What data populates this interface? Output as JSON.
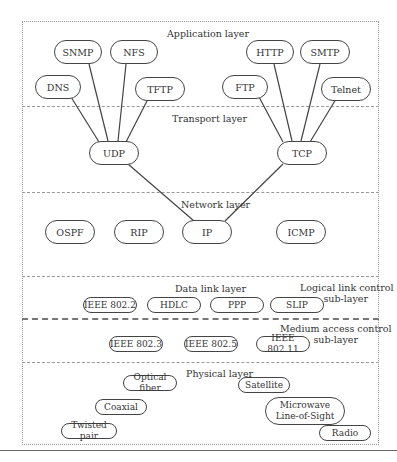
{
  "layers": {
    "application": "Application layer",
    "transport": "Transport layer",
    "network": "Network layer",
    "data_link": "Data link layer",
    "llc": "Logical link control sub-layer",
    "mac": "Medium access control sub-layer",
    "physical": "Physical layer"
  },
  "llc_lines": [
    "Logical link control",
    "sub-layer"
  ],
  "mac_lines": [
    "Medium access control",
    "sub-layer"
  ],
  "nodes": {
    "snmp": "SNMP",
    "nfs": "NFS",
    "dns": "DNS",
    "tftp": "TFTP",
    "http": "HTTP",
    "smtp": "SMTP",
    "ftp": "FTP",
    "telnet": "Telnet",
    "udp": "UDP",
    "tcp": "TCP",
    "ospf": "OSPF",
    "rip": "RIP",
    "ip": "IP",
    "icmp": "ICMP",
    "ieee8022": "IEEE 802.2",
    "hdlc": "HDLC",
    "ppp": "PPP",
    "slip": "SLIP",
    "ieee8023": "IEEE 802.3",
    "ieee8025": "IEEE 802.5",
    "ieee80211": "IEEE 802.11",
    "optical_fiber": "Optical fiber",
    "satellite": "Satellite",
    "coaxial": "Coaxial",
    "microwave_line1": "Microwave",
    "microwave_line2": "Line-of-Sight",
    "twisted_pair": "Twisted pair",
    "radio": "Radio"
  },
  "colors": {
    "stroke": "#444444",
    "divider": "#999999",
    "text": "#333333"
  }
}
